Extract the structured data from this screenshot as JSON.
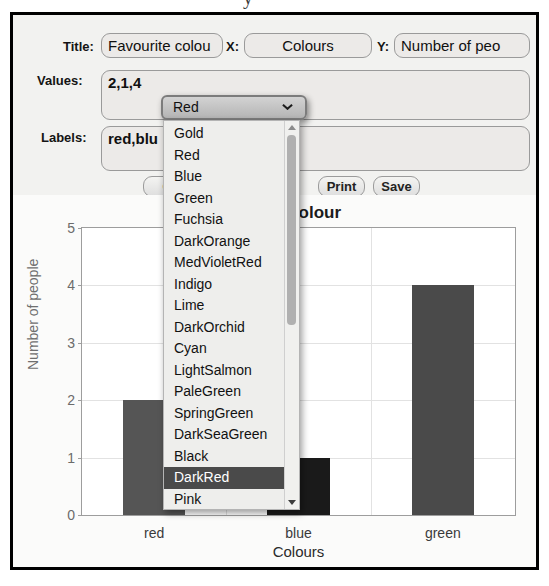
{
  "stray_glyph": "y",
  "form": {
    "title_label": "Title:",
    "title_value": "Favourite colou",
    "x_label": "X:",
    "x_value": "Colours",
    "y_label": "Y:",
    "y_value": "Number of peo",
    "values_label": "Values:",
    "values_value": "2,1,4",
    "labels_label": "Labels:",
    "labels_value": "red,blu"
  },
  "buttons": {
    "clear": "Cl",
    "draw": "",
    "print": "Print",
    "save": "Save"
  },
  "dropdown": {
    "selected_value": "Red",
    "chevron_icon": "chevron-down-icon",
    "scroll_up_icon": "scroll-up-arrow-icon",
    "scroll_down_icon": "scroll-down-arrow-icon",
    "highlighted_option": "DarkRed",
    "options": [
      "Gold",
      "Red",
      "Blue",
      "Green",
      "Fuchsia",
      "DarkOrange",
      "MedVioletRed",
      "Indigo",
      "Lime",
      "DarkOrchid",
      "Cyan",
      "LightSalmon",
      "PaleGreen",
      "SpringGreen",
      "DarkSeaGreen",
      "Black",
      "DarkRed",
      "Pink",
      "HotPink",
      "Coral"
    ]
  },
  "chart_data": {
    "type": "bar",
    "title": "Favourite colour",
    "title_visible_fragment": "ite colour",
    "categories": [
      "red",
      "blue",
      "green"
    ],
    "values": [
      2,
      1,
      4
    ],
    "bar_colors": [
      "#555555",
      "#1a1a1a",
      "#4a4a4a"
    ],
    "xlabel": "Colours",
    "ylabel": "Number of people",
    "ylim": [
      0,
      5
    ],
    "yticks": [
      0,
      1,
      2,
      3,
      4,
      5
    ],
    "grid": true,
    "legend": false
  }
}
